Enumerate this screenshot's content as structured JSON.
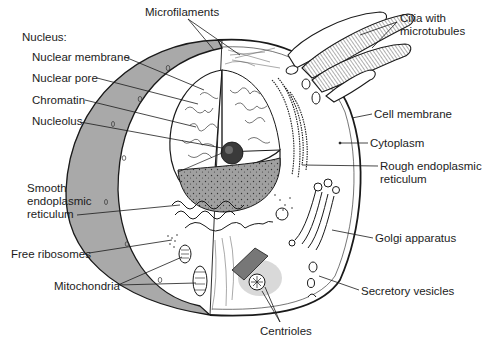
{
  "diagram": {
    "colors": {
      "line": "#1a1a1a",
      "cut_surface": "#a8a8a8",
      "nucleus_cut": "#9a9a9a",
      "background": "#ffffff"
    },
    "labels": [
      {
        "id": "microfilaments",
        "text": "Microfilaments",
        "x": 145,
        "y": 6
      },
      {
        "id": "nucleus-heading",
        "text": "Nucleus:",
        "x": 22,
        "y": 31
      },
      {
        "id": "nuclear-membrane",
        "text": "Nuclear membrane",
        "x": 32,
        "y": 51
      },
      {
        "id": "nuclear-pore",
        "text": "Nuclear pore",
        "x": 32,
        "y": 72
      },
      {
        "id": "chromatin",
        "text": "Chromatin",
        "x": 32,
        "y": 94
      },
      {
        "id": "nucleolus",
        "text": "Nucleolus",
        "x": 32,
        "y": 115
      },
      {
        "id": "smooth-er-line1",
        "text": "Smooth",
        "x": 27,
        "y": 182
      },
      {
        "id": "smooth-er-line2",
        "text": "endoplasmic",
        "x": 27,
        "y": 196
      },
      {
        "id": "smooth-er-line3",
        "text": "reticulum",
        "x": 27,
        "y": 210
      },
      {
        "id": "free-ribosomes",
        "text": "Free ribosomes",
        "x": 11,
        "y": 248
      },
      {
        "id": "mitochondria",
        "text": "Mitochondria",
        "x": 54,
        "y": 280
      },
      {
        "id": "cilia-line1",
        "text": "Cilia with",
        "x": 400,
        "y": 12
      },
      {
        "id": "cilia-line2",
        "text": "microtubules",
        "x": 400,
        "y": 26
      },
      {
        "id": "cell-membrane",
        "text": "Cell membrane",
        "x": 374,
        "y": 108
      },
      {
        "id": "cytoplasm",
        "text": "Cytoplasm",
        "x": 370,
        "y": 137
      },
      {
        "id": "rough-er-line1",
        "text": "Rough endoplasmic",
        "x": 380,
        "y": 160
      },
      {
        "id": "rough-er-line2",
        "text": "reticulum",
        "x": 380,
        "y": 174
      },
      {
        "id": "golgi",
        "text": "Golgi apparatus",
        "x": 375,
        "y": 232
      },
      {
        "id": "secretory-vesicles",
        "text": "Secretory vesicles",
        "x": 361,
        "y": 285
      },
      {
        "id": "centrioles",
        "text": "Centrioles",
        "x": 260,
        "y": 325
      }
    ]
  }
}
